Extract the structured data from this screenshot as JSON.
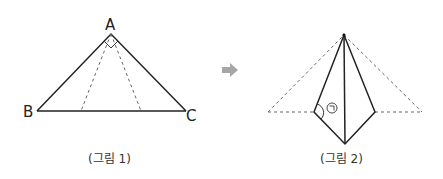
{
  "figure1": {
    "caption": "(그림 1)",
    "vertices": {
      "A": {
        "label": "A",
        "x": 111,
        "y": 34
      },
      "B": {
        "label": "B",
        "x": 37,
        "y": 111
      },
      "C": {
        "label": "C",
        "x": 186,
        "y": 111
      }
    },
    "fold_lines": [
      {
        "from": "A",
        "to_x": 81,
        "to_y": 111
      },
      {
        "from": "A",
        "to_x": 141,
        "to_y": 111
      }
    ],
    "right_angle_at": "A"
  },
  "arrow": {
    "symbol": "➡",
    "color": "#a6a6a6"
  },
  "figure2": {
    "caption": "(그림 2)",
    "angle_label": "㉠",
    "points": {
      "top": {
        "x": 344,
        "y": 35
      },
      "bottom": {
        "x": 345,
        "y": 144
      },
      "left": {
        "x": 314,
        "y": 112
      },
      "right": {
        "x": 375,
        "y": 112
      },
      "dashed_left": {
        "x": 268,
        "y": 112
      },
      "dashed_right": {
        "x": 422,
        "y": 112
      }
    }
  },
  "colors": {
    "line": "#222222",
    "dashed": "#666666"
  }
}
